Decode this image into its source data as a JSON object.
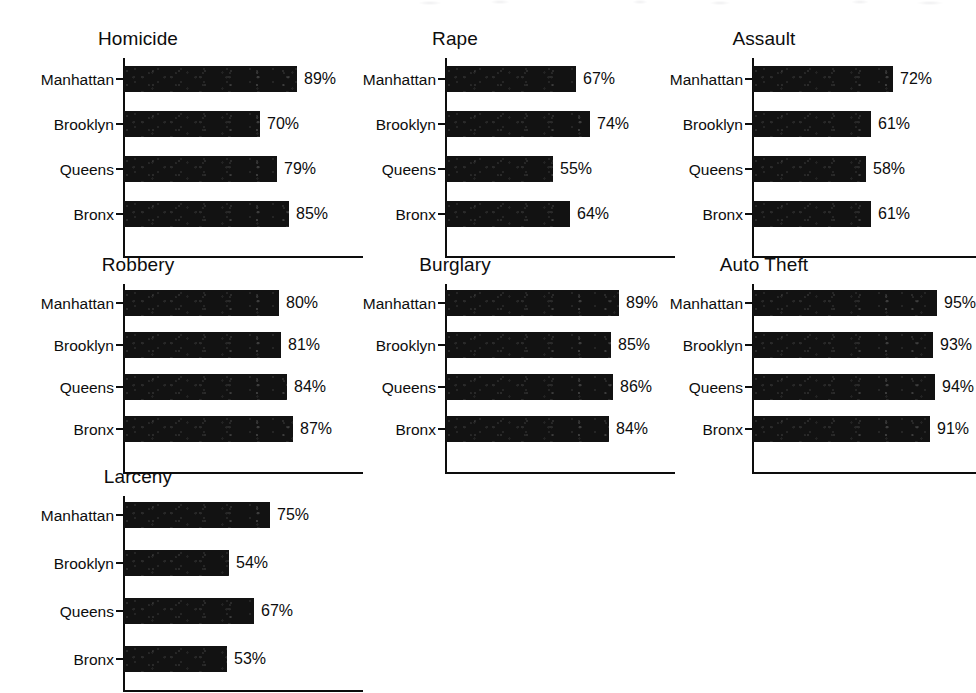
{
  "figure": {
    "categories": [
      "Manhattan",
      "Brooklyn",
      "Queens",
      "Bronx"
    ],
    "value_suffix": "%",
    "bar_color": "#121212",
    "axis_color": "#0d0d0d",
    "background_color": "#ffffff"
  },
  "chart_data": [
    {
      "type": "bar",
      "title": "Homicide",
      "orientation": "horizontal",
      "categories": [
        "Manhattan",
        "Brooklyn",
        "Queens",
        "Bronx"
      ],
      "values": [
        89,
        70,
        79,
        85
      ],
      "labels": [
        "89%",
        "70%",
        "79%",
        "85%"
      ],
      "xlabel": "",
      "ylabel": "",
      "xlim": [
        0,
        100
      ],
      "grid": false,
      "legend": false
    },
    {
      "type": "bar",
      "title": "Rape",
      "orientation": "horizontal",
      "categories": [
        "Manhattan",
        "Brooklyn",
        "Queens",
        "Bronx"
      ],
      "values": [
        67,
        74,
        55,
        64
      ],
      "labels": [
        "67%",
        "74%",
        "55%",
        "64%"
      ],
      "xlabel": "",
      "ylabel": "",
      "xlim": [
        0,
        100
      ],
      "grid": false,
      "legend": false
    },
    {
      "type": "bar",
      "title": "Assault",
      "orientation": "horizontal",
      "categories": [
        "Manhattan",
        "Brooklyn",
        "Queens",
        "Bronx"
      ],
      "values": [
        72,
        61,
        58,
        61
      ],
      "labels": [
        "72%",
        "61%",
        "58%",
        "61%"
      ],
      "xlabel": "",
      "ylabel": "",
      "xlim": [
        0,
        100
      ],
      "grid": false,
      "legend": false
    },
    {
      "type": "bar",
      "title": "Robbery",
      "orientation": "horizontal",
      "categories": [
        "Manhattan",
        "Brooklyn",
        "Queens",
        "Bronx"
      ],
      "values": [
        80,
        81,
        84,
        87
      ],
      "labels": [
        "80%",
        "81%",
        "84%",
        "87%"
      ],
      "xlabel": "",
      "ylabel": "",
      "xlim": [
        0,
        100
      ],
      "grid": false,
      "legend": false
    },
    {
      "type": "bar",
      "title": "Burglary",
      "orientation": "horizontal",
      "categories": [
        "Manhattan",
        "Brooklyn",
        "Queens",
        "Bronx"
      ],
      "values": [
        89,
        85,
        86,
        84
      ],
      "labels": [
        "89%",
        "85%",
        "86%",
        "84%"
      ],
      "xlabel": "",
      "ylabel": "",
      "xlim": [
        0,
        100
      ],
      "grid": false,
      "legend": false
    },
    {
      "type": "bar",
      "title": "Auto Theft",
      "orientation": "horizontal",
      "categories": [
        "Manhattan",
        "Brooklyn",
        "Queens",
        "Bronx"
      ],
      "values": [
        95,
        93,
        94,
        91
      ],
      "labels": [
        "95%",
        "93%",
        "94%",
        "91%"
      ],
      "xlabel": "",
      "ylabel": "",
      "xlim": [
        0,
        100
      ],
      "grid": false,
      "legend": false
    },
    {
      "type": "bar",
      "title": "Larceny",
      "orientation": "horizontal",
      "categories": [
        "Manhattan",
        "Brooklyn",
        "Queens",
        "Bronx"
      ],
      "values": [
        75,
        54,
        67,
        53
      ],
      "labels": [
        "75%",
        "54%",
        "67%",
        "53%"
      ],
      "xlabel": "",
      "ylabel": "",
      "xlim": [
        0,
        100
      ],
      "grid": false,
      "legend": false
    }
  ],
  "layout": {
    "panels": [
      {
        "left": 123,
        "top": 28,
        "title_left": -105,
        "title_width": 240,
        "plot_top": 30,
        "plot_width": 240,
        "plot_height": 200,
        "row_height": 26,
        "row_gap": 19,
        "first_row_top": 8,
        "px_per_unit": 1.94
      },
      {
        "left": 445,
        "top": 28,
        "title_left": -105,
        "title_width": 230,
        "plot_top": 30,
        "plot_width": 230,
        "plot_height": 200,
        "row_height": 26,
        "row_gap": 19,
        "first_row_top": 8,
        "px_per_unit": 1.94
      },
      {
        "left": 752,
        "top": 28,
        "title_left": -100,
        "title_width": 224,
        "plot_top": 30,
        "plot_width": 224,
        "plot_height": 200,
        "row_height": 26,
        "row_gap": 19,
        "first_row_top": 8,
        "px_per_unit": 1.94
      },
      {
        "left": 123,
        "top": 254,
        "title_left": -105,
        "title_width": 240,
        "plot_top": 30,
        "plot_width": 240,
        "plot_height": 190,
        "row_height": 26,
        "row_gap": 16,
        "first_row_top": 6,
        "px_per_unit": 1.94
      },
      {
        "left": 445,
        "top": 254,
        "title_left": -105,
        "title_width": 230,
        "plot_top": 30,
        "plot_width": 230,
        "plot_height": 190,
        "row_height": 26,
        "row_gap": 16,
        "first_row_top": 6,
        "px_per_unit": 1.94
      },
      {
        "left": 752,
        "top": 254,
        "title_left": -100,
        "title_width": 224,
        "plot_top": 30,
        "plot_width": 224,
        "plot_height": 190,
        "row_height": 26,
        "row_gap": 16,
        "first_row_top": 6,
        "px_per_unit": 1.94
      },
      {
        "left": 123,
        "top": 466,
        "title_left": -105,
        "title_width": 240,
        "plot_top": 30,
        "plot_width": 240,
        "plot_height": 196,
        "row_height": 26,
        "row_gap": 22,
        "first_row_top": 6,
        "px_per_unit": 1.94
      }
    ]
  }
}
